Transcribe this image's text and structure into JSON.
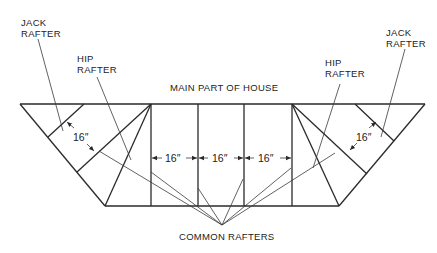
{
  "diagram": {
    "labels": {
      "jack_left_1": "JACK",
      "jack_left_2": "RAFTER",
      "hip_left_1": "HIP",
      "hip_left_2": "RAFTER",
      "main": "MAIN PART OF HOUSE",
      "hip_right_1": "HIP",
      "hip_right_2": "RAFTER",
      "jack_right_1": "JACK",
      "jack_right_2": "RAFTER",
      "common": "COMMON RAFTERS"
    },
    "dimensions": {
      "left_jack_spacing": "16″",
      "common_spacing_1": "16″",
      "common_spacing_2": "16″",
      "common_spacing_3": "16″",
      "right_jack_spacing": "16″"
    },
    "colors": {
      "line": "#2a2a2a",
      "text": "#222222",
      "background": "#ffffff"
    }
  }
}
